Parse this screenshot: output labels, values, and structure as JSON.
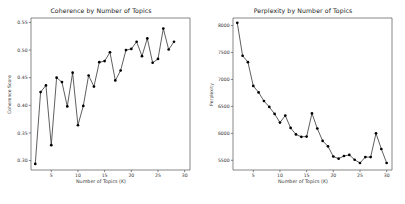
{
  "figure": {
    "background": "#ffffff",
    "width": 405,
    "height": 204
  },
  "panels": {
    "left": {
      "title": "Coherence by Number of Topics",
      "xlabel": "Number of Topics (K)",
      "ylabel": "Coherence Score"
    },
    "right": {
      "title": "Perplexity by Number of Topics",
      "xlabel": "Number of Topics (K)",
      "ylabel": "Perplexity"
    }
  },
  "chart_data": [
    {
      "type": "line",
      "title": "Coherence by Number of Topics",
      "xlabel": "Number of Topics (K)",
      "ylabel": "Coherence Score",
      "marker": "filled-circle",
      "line_color": "#1a1a1a",
      "marker_color": "#000000",
      "grid": false,
      "legend": null,
      "xlim": [
        1.2,
        31.0
      ],
      "ylim": [
        0.283,
        0.558
      ],
      "xticks": [
        5,
        10,
        15,
        20,
        25,
        30
      ],
      "yticks": [
        0.3,
        0.35,
        0.4,
        0.45,
        0.5,
        0.55
      ],
      "ytick_labels": [
        "0.30",
        "0.35",
        "0.40",
        "0.45",
        "0.50",
        "0.55"
      ],
      "xtick_labels": [
        "5",
        "10",
        "15",
        "20",
        "25",
        "30"
      ],
      "x": [
        2,
        3,
        4,
        5,
        6,
        7,
        8,
        9,
        10,
        11,
        12,
        13,
        14,
        15,
        16,
        17,
        18,
        19,
        20,
        21,
        22,
        23,
        24,
        25,
        26,
        27,
        28,
        29,
        30
      ],
      "values": [
        0.294,
        0.424,
        0.436,
        0.328,
        0.45,
        0.442,
        0.398,
        0.459,
        0.364,
        0.399,
        0.454,
        0.434,
        0.478,
        0.48,
        0.496,
        0.445,
        0.463,
        0.5,
        0.502,
        0.515,
        0.489,
        0.521,
        0.477,
        0.484,
        0.539,
        0.501,
        0.515
      ]
    },
    {
      "type": "line",
      "title": "Perplexity by Number of Topics",
      "xlabel": "Number of Topics (K)",
      "ylabel": "Perplexity",
      "marker": "filled-circle",
      "line_color": "#1a1a1a",
      "marker_color": "#000000",
      "grid": false,
      "legend": null,
      "xlim": [
        1.2,
        31.0
      ],
      "ylim": [
        5320,
        8140
      ],
      "xticks": [
        5,
        10,
        15,
        20,
        25,
        30
      ],
      "yticks": [
        5500,
        6000,
        6500,
        7000,
        7500,
        8000
      ],
      "ytick_labels": [
        "5500",
        "6000",
        "6500",
        "7000",
        "7500",
        "8000"
      ],
      "xtick_labels": [
        "5",
        "10",
        "15",
        "20",
        "25",
        "30"
      ],
      "x": [
        2,
        3,
        4,
        5,
        6,
        7,
        8,
        9,
        10,
        11,
        12,
        13,
        14,
        15,
        16,
        17,
        18,
        19,
        20,
        21,
        22,
        23,
        24,
        25,
        26,
        27,
        28,
        29,
        30
      ],
      "values": [
        8050,
        7440,
        7320,
        6880,
        6760,
        6600,
        6490,
        6360,
        6200,
        6330,
        6100,
        5980,
        5935,
        5940,
        6370,
        6090,
        5860,
        5760,
        5570,
        5530,
        5580,
        5600,
        5510,
        5450,
        5560,
        5560,
        6000,
        5710,
        5450,
        5590,
        5570
      ]
    }
  ]
}
